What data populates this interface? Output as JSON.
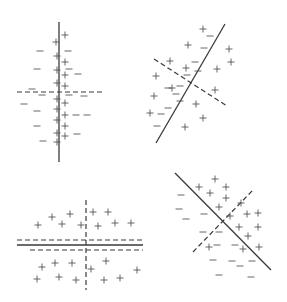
{
  "figure": {
    "ink_color": "#3a3a3a",
    "marker_color": "#555555",
    "background": "#ffffff",
    "panels": [
      {
        "id": "top-left",
        "solid": [
          [
            59,
            22
          ],
          [
            59,
            162
          ]
        ],
        "dashed": [
          [
            [
              17,
              92
            ],
            [
              103,
              92
            ]
          ]
        ],
        "plus": [
          [
            65,
            35
          ],
          [
            56,
            42
          ],
          [
            57,
            56
          ],
          [
            65,
            62
          ],
          [
            57,
            70
          ],
          [
            65,
            75
          ],
          [
            57,
            83
          ],
          [
            65,
            86
          ],
          [
            57,
            99
          ],
          [
            65,
            103
          ],
          [
            57,
            109
          ],
          [
            65,
            115
          ],
          [
            57,
            120
          ],
          [
            65,
            126
          ],
          [
            57,
            133
          ],
          [
            65,
            136
          ],
          [
            57,
            142
          ]
        ],
        "minus": [
          [
            40,
            51
          ],
          [
            68,
            51
          ],
          [
            37,
            69
          ],
          [
            69,
            69
          ],
          [
            78,
            74
          ],
          [
            32,
            89
          ],
          [
            42,
            95
          ],
          [
            69,
            95
          ],
          [
            84,
            96
          ],
          [
            24,
            104
          ],
          [
            37,
            111
          ],
          [
            76,
            115
          ],
          [
            87,
            115
          ],
          [
            37,
            126
          ],
          [
            77,
            134
          ],
          [
            43,
            141
          ]
        ]
      },
      {
        "id": "top-right",
        "solid": [
          [
            156,
            143
          ],
          [
            225,
            24
          ]
        ],
        "dashed": [
          [
            [
              154,
              59
            ],
            [
              227,
              106
            ]
          ]
        ],
        "plus": [
          [
            203,
            29
          ],
          [
            188,
            45
          ],
          [
            229,
            49
          ],
          [
            231,
            62
          ],
          [
            170,
            61
          ],
          [
            186,
            68
          ],
          [
            217,
            69
          ],
          [
            156,
            76
          ],
          [
            172,
            88
          ],
          [
            215,
            90
          ],
          [
            154,
            96
          ],
          [
            150,
            113
          ],
          [
            196,
            104
          ],
          [
            203,
            118
          ],
          [
            185,
            127
          ]
        ],
        "minus": [
          [
            210,
            36
          ],
          [
            204,
            48
          ],
          [
            195,
            62
          ],
          [
            198,
            71
          ],
          [
            187,
            75
          ],
          [
            180,
            86
          ],
          [
            176,
            94
          ],
          [
            168,
            88
          ],
          [
            180,
            101
          ],
          [
            168,
            108
          ],
          [
            161,
            114
          ],
          [
            157,
            126
          ]
        ]
      },
      {
        "id": "bottom-left",
        "solid": [
          [
            17,
            245
          ],
          [
            143,
            245
          ]
        ],
        "dashed": [
          [
            [
              17,
              240
            ],
            [
              143,
              240
            ]
          ],
          [
            [
              30,
              250
            ],
            [
              143,
              250
            ]
          ],
          [
            [
              86,
              200
            ],
            [
              86,
              290
            ]
          ]
        ],
        "plus": [
          [
            38,
            225
          ],
          [
            52,
            217
          ],
          [
            62,
            224
          ],
          [
            70,
            214
          ],
          [
            81,
            225
          ],
          [
            93,
            212
          ],
          [
            108,
            212
          ],
          [
            98,
            226
          ],
          [
            115,
            223
          ],
          [
            131,
            223
          ],
          [
            42,
            267
          ],
          [
            55,
            263
          ],
          [
            72,
            263
          ],
          [
            91,
            269
          ],
          [
            106,
            261
          ],
          [
            137,
            270
          ],
          [
            37,
            279
          ],
          [
            59,
            277
          ],
          [
            76,
            280
          ],
          [
            104,
            280
          ],
          [
            120,
            278
          ]
        ],
        "minus": []
      },
      {
        "id": "bottom-right",
        "solid": [
          [
            175,
            173
          ],
          [
            271,
            270
          ]
        ],
        "dashed": [
          [
            [
              193,
              252
            ],
            [
              253,
              190
            ]
          ]
        ],
        "plus": [
          [
            215,
            179
          ],
          [
            199,
            187
          ],
          [
            210,
            193
          ],
          [
            226,
            187
          ],
          [
            226,
            198
          ],
          [
            219,
            207
          ],
          [
            241,
            203
          ],
          [
            230,
            216
          ],
          [
            247,
            214
          ],
          [
            258,
            213
          ],
          [
            239,
            227
          ],
          [
            258,
            227
          ],
          [
            248,
            236
          ],
          [
            259,
            247
          ],
          [
            243,
            249
          ],
          [
            209,
            247
          ]
        ],
        "minus": [
          [
            181,
            195
          ],
          [
            179,
            209
          ],
          [
            186,
            219
          ],
          [
            204,
            214
          ],
          [
            203,
            232
          ],
          [
            219,
            232
          ],
          [
            217,
            245
          ],
          [
            235,
            245
          ],
          [
            213,
            260
          ],
          [
            232,
            261
          ],
          [
            219,
            275
          ],
          [
            240,
            266
          ],
          [
            251,
            277
          ],
          [
            252,
            261
          ]
        ]
      }
    ]
  }
}
